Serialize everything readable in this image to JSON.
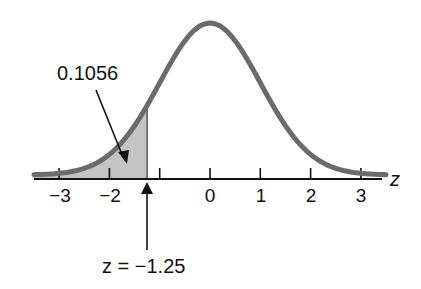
{
  "chart_data": {
    "type": "area",
    "title": "",
    "xlabel": "z",
    "ylabel": "",
    "xlim": [
      -3.5,
      3.5
    ],
    "x_ticks": [
      -3,
      -2,
      -1,
      0,
      1,
      2,
      3
    ],
    "x_tick_labels": [
      "−3",
      "−2",
      "",
      "0",
      "1",
      "2",
      "3"
    ],
    "shaded_region": {
      "from": "-inf",
      "to": -1.25,
      "area": 0.1056
    },
    "annotations": [
      {
        "text": "0.1056",
        "points_to": "shaded area"
      },
      {
        "text": "z = −1.25",
        "points_to": "z = -1.25 on axis"
      }
    ],
    "grid": false,
    "legend": "none",
    "colors": {
      "curve": "#6b6b6b",
      "shade": "#c4c4c4",
      "axis": "#111111"
    }
  },
  "labels": {
    "area_value": "0.1056",
    "z_marker": "z = −1.25",
    "axis_var": "z",
    "ticks": [
      "−3",
      "−2",
      "0",
      "1",
      "2",
      "3"
    ]
  }
}
